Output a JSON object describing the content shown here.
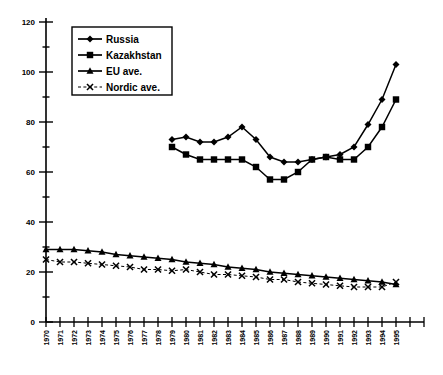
{
  "chart_data": {
    "type": "line",
    "title": "",
    "xlabel": "",
    "ylabel": "",
    "xlim": [
      1970,
      1996
    ],
    "ylim": [
      0,
      120
    ],
    "y_major_ticks": [
      0,
      20,
      40,
      60,
      80,
      100,
      120
    ],
    "y_minor_interval": 10,
    "grid": false,
    "legend_position": "top-left",
    "x_tick_labels": [
      "1970",
      "1971",
      "1972",
      "1973",
      "1974",
      "1975",
      "1976",
      "1977",
      "1978",
      "1979",
      "1980",
      "1981",
      "1982",
      "1983",
      "1984",
      "1985",
      "1986",
      "1987",
      "1988",
      "1989",
      "1990",
      "1991",
      "1992",
      "1993",
      "1994",
      "1995"
    ],
    "series": [
      {
        "name": "Russia",
        "marker": "diamond",
        "line": "solid",
        "x": [
          1979,
          1980,
          1981,
          1982,
          1983,
          1984,
          1985,
          1986,
          1987,
          1988,
          1989,
          1990,
          1991,
          1992,
          1993,
          1994,
          1995
        ],
        "values": [
          73,
          74,
          72,
          72,
          74,
          78,
          73,
          66,
          64,
          64,
          65,
          66,
          67,
          70,
          79,
          89,
          103
        ]
      },
      {
        "name": "Kazakhstan",
        "marker": "square",
        "line": "solid",
        "x": [
          1979,
          1980,
          1981,
          1982,
          1983,
          1984,
          1985,
          1986,
          1987,
          1988,
          1989,
          1990,
          1991,
          1992,
          1993,
          1994,
          1995
        ],
        "values": [
          70,
          67,
          65,
          65,
          65,
          65,
          62,
          57,
          57,
          60,
          65,
          66,
          65,
          65,
          70,
          78,
          89
        ]
      },
      {
        "name": "EU ave.",
        "marker": "triangle",
        "line": "solid",
        "x": [
          1970,
          1971,
          1972,
          1973,
          1974,
          1975,
          1976,
          1977,
          1978,
          1979,
          1980,
          1981,
          1982,
          1983,
          1984,
          1985,
          1986,
          1987,
          1988,
          1989,
          1990,
          1991,
          1992,
          1993,
          1994,
          1995
        ],
        "values": [
          29,
          29,
          29,
          28.5,
          28,
          27,
          26.5,
          26,
          25.5,
          25,
          24,
          23.5,
          23,
          22,
          21.5,
          21,
          20,
          19.5,
          19,
          18.5,
          18,
          17.5,
          17,
          16.5,
          16,
          15
        ]
      },
      {
        "name": "Nordic ave.",
        "marker": "x",
        "line": "dashed",
        "x": [
          1970,
          1971,
          1972,
          1973,
          1974,
          1975,
          1976,
          1977,
          1978,
          1979,
          1980,
          1981,
          1982,
          1983,
          1984,
          1985,
          1986,
          1987,
          1988,
          1989,
          1990,
          1991,
          1992,
          1993,
          1994,
          1995
        ],
        "values": [
          25,
          24,
          24,
          23.5,
          23,
          22.5,
          22,
          21,
          21,
          20.5,
          21,
          20,
          19,
          19,
          18.5,
          18,
          17,
          17,
          16,
          15.5,
          15,
          14.5,
          14,
          14,
          14,
          16
        ]
      }
    ]
  },
  "legend": {
    "items": [
      {
        "label": "Russia"
      },
      {
        "label": "Kazakhstan"
      },
      {
        "label": "EU ave."
      },
      {
        "label": "Nordic ave."
      }
    ]
  }
}
